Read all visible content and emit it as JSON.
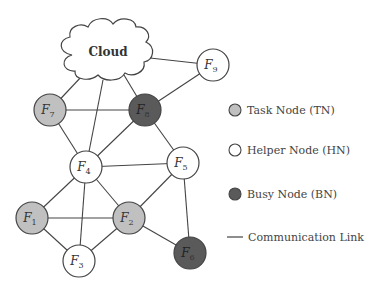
{
  "diagram": {
    "cloud": {
      "label": "Cloud",
      "x": 108,
      "y": 52
    },
    "colors": {
      "task": "#c0c0c0",
      "helper": "#ffffff",
      "busy": "#5a5a5a",
      "stroke": "#444444",
      "link": "#444444"
    },
    "nodes": [
      {
        "id": "F1",
        "base": "F",
        "sub": "1",
        "type": "task",
        "x": 32,
        "y": 218
      },
      {
        "id": "F2",
        "base": "F",
        "sub": "2",
        "type": "task",
        "x": 129,
        "y": 218
      },
      {
        "id": "F3",
        "base": "F",
        "sub": "3",
        "type": "helper",
        "x": 79,
        "y": 261
      },
      {
        "id": "F4",
        "base": "F",
        "sub": "4",
        "type": "helper",
        "x": 86,
        "y": 167
      },
      {
        "id": "F5",
        "base": "F",
        "sub": "5",
        "type": "helper",
        "x": 183,
        "y": 163
      },
      {
        "id": "F6",
        "base": "F",
        "sub": "6",
        "type": "busy",
        "x": 190,
        "y": 253
      },
      {
        "id": "F7",
        "base": "F",
        "sub": "7",
        "type": "task",
        "x": 50,
        "y": 110
      },
      {
        "id": "F8",
        "base": "F",
        "sub": "8",
        "type": "busy",
        "x": 145,
        "y": 110
      },
      {
        "id": "F9",
        "base": "F",
        "sub": "9",
        "type": "helper",
        "x": 213,
        "y": 65
      }
    ],
    "edges": [
      [
        "Cloud",
        "F9"
      ],
      [
        "Cloud",
        "F7"
      ],
      [
        "Cloud",
        "F4"
      ],
      [
        "Cloud",
        "F8"
      ],
      [
        "F9",
        "F8"
      ],
      [
        "F7",
        "F8"
      ],
      [
        "F7",
        "F4"
      ],
      [
        "F8",
        "F4"
      ],
      [
        "F8",
        "F5"
      ],
      [
        "F4",
        "F5"
      ],
      [
        "F4",
        "F1"
      ],
      [
        "F4",
        "F2"
      ],
      [
        "F4",
        "F3"
      ],
      [
        "F1",
        "F2"
      ],
      [
        "F1",
        "F3"
      ],
      [
        "F3",
        "F2"
      ],
      [
        "F2",
        "F5"
      ],
      [
        "F2",
        "F6"
      ],
      [
        "F5",
        "F6"
      ]
    ],
    "legend": [
      {
        "type": "task",
        "label": "Task Node (TN)"
      },
      {
        "type": "helper",
        "label": "Helper Node (HN)"
      },
      {
        "type": "busy",
        "label": "Busy Node (BN)"
      },
      {
        "type": "link",
        "label": "Communication Link"
      }
    ]
  }
}
